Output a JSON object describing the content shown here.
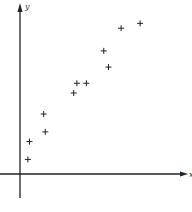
{
  "chart_data": {
    "type": "scatter",
    "title": "",
    "xlabel": "x",
    "ylabel": "y",
    "marker": "plus",
    "grid": false,
    "legend": "none",
    "xlim": [
      0,
      10
    ],
    "ylim": [
      0,
      10
    ],
    "points": [
      {
        "x": 0.5,
        "y": 0.9
      },
      {
        "x": 0.6,
        "y": 2.0
      },
      {
        "x": 1.6,
        "y": 2.6
      },
      {
        "x": 1.5,
        "y": 3.7
      },
      {
        "x": 3.4,
        "y": 5.0
      },
      {
        "x": 3.6,
        "y": 5.6
      },
      {
        "x": 4.2,
        "y": 5.6
      },
      {
        "x": 5.6,
        "y": 6.6
      },
      {
        "x": 5.3,
        "y": 7.6
      },
      {
        "x": 6.4,
        "y": 9.0
      },
      {
        "x": 7.6,
        "y": 9.3
      }
    ],
    "colors": {
      "axis": "#222222",
      "marker": "#222222"
    }
  }
}
